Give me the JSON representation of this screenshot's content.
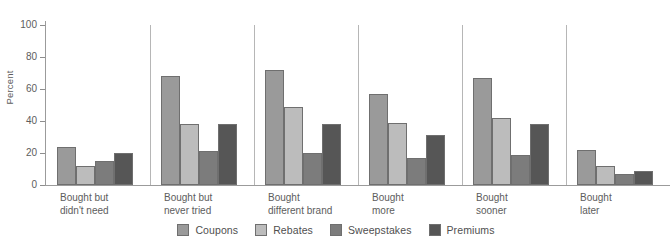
{
  "chart_data": {
    "type": "bar",
    "title": "",
    "xlabel": "",
    "ylabel": "Percent",
    "ylim": [
      0,
      100
    ],
    "yticks": [
      0,
      20,
      40,
      60,
      80,
      100
    ],
    "grid": false,
    "legend_position": "bottom",
    "categories": [
      "Bought but\ndidn't need",
      "Bought but\nnever tried",
      "Bought\ndifferent brand",
      "Bought\nmore",
      "Bought\nsooner",
      "Bought\nlater"
    ],
    "category_lines": [
      [
        "Bought but",
        "didn't need"
      ],
      [
        "Bought but",
        "never tried"
      ],
      [
        "Bought",
        "different brand"
      ],
      [
        "Bought",
        "more"
      ],
      [
        "Bought",
        "sooner"
      ],
      [
        "Bought",
        "later"
      ]
    ],
    "series": [
      {
        "name": "Coupons",
        "color": "#9a9a9a",
        "values": [
          24,
          68,
          72,
          57,
          67,
          22
        ]
      },
      {
        "name": "Rebates",
        "color": "#bcbcbc",
        "values": [
          12,
          38,
          49,
          39,
          42,
          12
        ]
      },
      {
        "name": "Sweepstakes",
        "color": "#7c7c7c",
        "values": [
          15,
          21,
          20,
          17,
          19,
          7
        ]
      },
      {
        "name": "Premiums",
        "color": "#565656",
        "values": [
          20,
          38,
          38,
          31,
          38,
          9
        ]
      }
    ]
  },
  "axis": {
    "y_title": "Percent",
    "y_tick_labels": [
      "100",
      "80",
      "60",
      "40",
      "20",
      "0"
    ]
  },
  "legend": {
    "items": [
      {
        "label": "Coupons"
      },
      {
        "label": "Rebates"
      },
      {
        "label": "Sweepstakes"
      },
      {
        "label": "Premiums"
      }
    ]
  }
}
